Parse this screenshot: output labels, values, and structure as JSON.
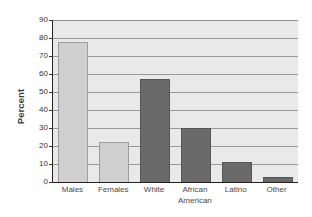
{
  "chart_data": {
    "type": "bar",
    "title": "",
    "subtitle": "",
    "xlabel": "",
    "ylabel": "Percent",
    "ylim": [
      0,
      90
    ],
    "ytick_step": 10,
    "yticks": [
      90,
      80,
      70,
      60,
      50,
      40,
      30,
      20,
      10,
      0
    ],
    "ytick_labels": [
      "90",
      "80",
      "70",
      "60",
      "50",
      "40",
      "30",
      "20",
      "10",
      "0"
    ],
    "grid": "horizontal",
    "legend": "none",
    "categories": [
      "Males",
      "Females",
      "White",
      "African American",
      "Latino",
      "Other"
    ],
    "category_labels": [
      "Males",
      "Females",
      "White",
      "African\nAmerican",
      "Latino",
      "Other"
    ],
    "values": [
      78,
      22,
      57,
      30,
      11,
      3
    ],
    "bar_styles": [
      "light",
      "light",
      "dark",
      "dark",
      "dark",
      "dark"
    ],
    "annotations": []
  },
  "colors": {
    "plot_background": "#e9e9e9",
    "page_background": "#ffffff",
    "gridline": "#9a9a9a",
    "axis_line": "#222222",
    "bar_light_fill": "#cfcfcf",
    "bar_light_border": "#9d9d9d",
    "bar_dark_fill": "#6a6a6a",
    "bar_dark_border": "#565656",
    "tick_text": "#333333",
    "category_text": "#4a4a4a",
    "axis_title_text": "#3b3b3b"
  }
}
